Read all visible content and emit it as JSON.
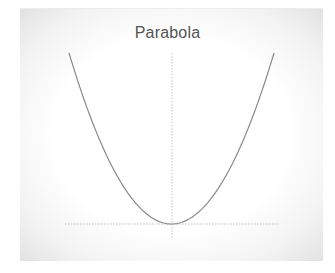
{
  "chart_data": {
    "type": "line",
    "title": "Parabola",
    "xlabel": "",
    "ylabel": "",
    "grid": false,
    "legend": null,
    "axes": {
      "x_axis_style": "dotted",
      "y_axis_style": "dotted"
    },
    "function": "y = x^2",
    "x": [
      -1.0,
      -0.8,
      -0.6,
      -0.4,
      -0.2,
      0.0,
      0.2,
      0.4,
      0.6,
      0.8,
      1.0
    ],
    "series": [
      {
        "name": "y = x^2",
        "values": [
          1.0,
          0.64,
          0.36,
          0.16,
          0.04,
          0.0,
          0.04,
          0.16,
          0.36,
          0.64,
          1.0
        ]
      }
    ],
    "xlim": [
      -1.05,
      1.05
    ],
    "ylim": [
      -0.08,
      1.0
    ],
    "colors": {
      "curve": "#8a8a8a",
      "axes": "#bdbdbd",
      "title": "#555555"
    }
  }
}
